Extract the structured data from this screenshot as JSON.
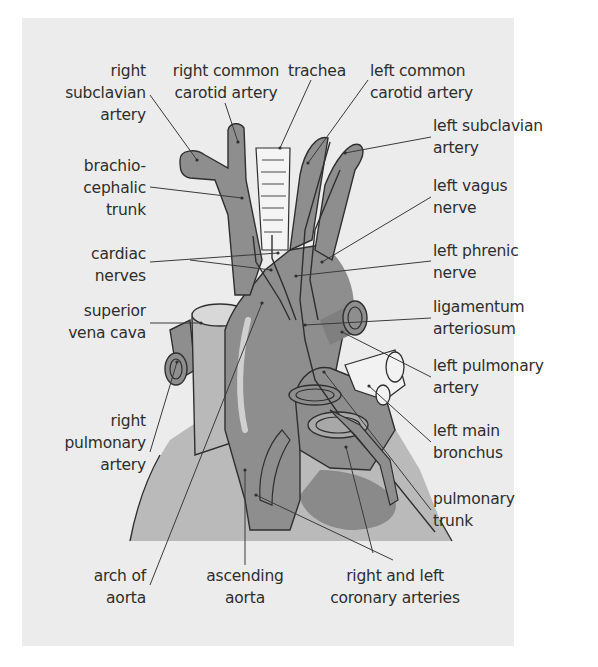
{
  "diagram": {
    "title": "",
    "colors": {
      "panel_background": "#ececec",
      "vessel_fill": "#8e8e8e",
      "vessel_dark": "#7a7a7a",
      "heart_fill": "#b9b9b9",
      "heart_dark": "#8a8a8a",
      "trachea_fill": "#f4f4f4",
      "outline": "#2f2f2f",
      "leader_line": "#3a3a3a",
      "text": "#2e2e2e"
    },
    "labels": {
      "right_subclavian_artery": "right\nsubclavian\nartery",
      "right_common_carotid_artery": "right common\ncarotid artery",
      "trachea": "trachea",
      "left_common_carotid_artery": "left common\ncarotid artery",
      "left_subclavian_artery": "left subclavian\nartery",
      "brachiocephalic_trunk": "brachio-\ncephalic\ntrunk",
      "left_vagus_nerve": "left vagus\nnerve",
      "cardiac_nerves": "cardiac\nnerves",
      "left_phrenic_nerve": "left phrenic\nnerve",
      "superior_vena_cava": "superior\nvena cava",
      "ligamentum_arteriosum": "ligamentum\narteriosum",
      "left_pulmonary_artery": "left pulmonary\nartery",
      "right_pulmonary_artery": "right\npulmonary\nartery",
      "left_main_bronchus": "left main\nbronchus",
      "pulmonary_trunk": "pulmonary\ntrunk",
      "arch_of_aorta": "arch of\naorta",
      "ascending_aorta": "ascending\naorta",
      "right_and_left_coronary_arteries": "right and left\ncoronary arteries"
    }
  }
}
